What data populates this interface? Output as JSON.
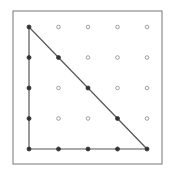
{
  "diagram": {
    "type": "geoboard",
    "grid": {
      "rows": 5,
      "cols": 5,
      "origin": [
        29,
        27
      ],
      "spacing_x": 29.5,
      "spacing_y": 30.5
    },
    "frame": {
      "x": 13,
      "y": 11,
      "width": 149,
      "height": 153,
      "stroke": "#777777"
    },
    "peg_color_empty": "#888888",
    "peg_color_on_shape": "#333333",
    "shape": {
      "name": "right-triangle",
      "vertices_grid": [
        [
          0,
          0
        ],
        [
          0,
          4
        ],
        [
          4,
          4
        ]
      ],
      "stroke": "#555555"
    }
  }
}
